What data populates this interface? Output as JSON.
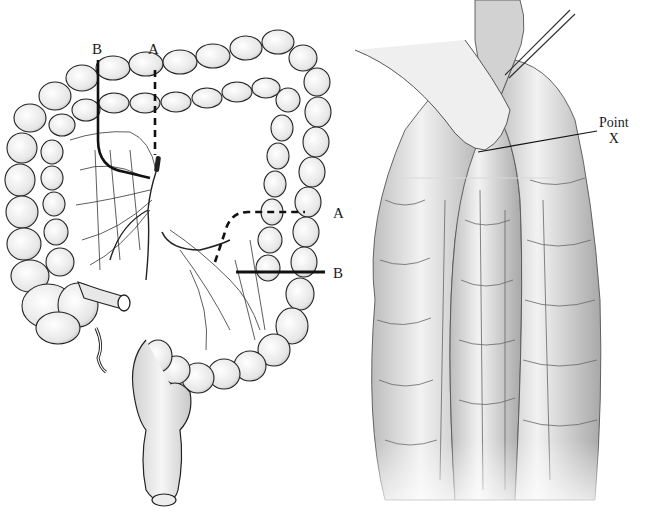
{
  "figure": {
    "left_panel": {
      "title": "Colon with resection lines",
      "labels": {
        "top_b": "B",
        "top_a": "A",
        "right_a": "A",
        "right_b": "B"
      },
      "line_styles": {
        "A": "dashed",
        "B": "solid"
      }
    },
    "right_panel": {
      "title": "Mesenteric vessel detail",
      "annotation": {
        "line1": "Point",
        "line2": "X"
      }
    },
    "colors": {
      "ink": "#1a1a1a",
      "shading": "#c8c8c8",
      "background": "#ffffff"
    }
  }
}
